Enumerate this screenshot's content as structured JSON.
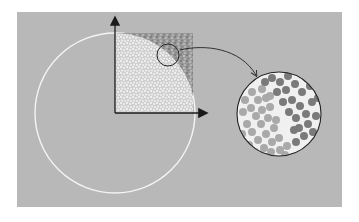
{
  "diagram": {
    "colors": {
      "background": "#ffffff",
      "panel": "#b8b8b8",
      "circle_outline": "#f4f4f4",
      "inside_points": "#e6e6e6",
      "outside_points": "#8a8a8a",
      "axis": "#1a1a1a",
      "magnifier_outline": "#222222",
      "magnified_light_dots": "#a9a9a9",
      "magnified_dark_dots": "#7a7a7a",
      "magnified_background": "#f0f0f0"
    },
    "elements": [
      {
        "name": "large-circle",
        "description": "white circle outline centered at axes origin"
      },
      {
        "name": "axes",
        "description": "x and y axes with arrowheads"
      },
      {
        "name": "sample-square",
        "description": "unit square filled with random points, inside-circle points light, outside darker"
      },
      {
        "name": "magnifier-circle",
        "description": "small circle marking region near the arc"
      },
      {
        "name": "connector-arrow",
        "description": "curved arrow from small circle to magnified view"
      },
      {
        "name": "magnified-view",
        "description": "enlarged circular view showing light and dark dots separated by the arc"
      }
    ]
  }
}
